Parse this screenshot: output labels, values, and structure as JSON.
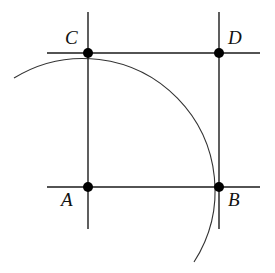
{
  "diagram": {
    "points": [
      {
        "id": "A",
        "label": "A"
      },
      {
        "id": "B",
        "label": "B"
      },
      {
        "id": "C",
        "label": "C"
      },
      {
        "id": "D",
        "label": "D"
      }
    ],
    "lines": [
      {
        "id": "vertical-through-A-C",
        "through": [
          "A",
          "C"
        ]
      },
      {
        "id": "vertical-through-B-D",
        "through": [
          "B",
          "D"
        ]
      },
      {
        "id": "horizontal-through-C-D",
        "through": [
          "C",
          "D"
        ]
      },
      {
        "id": "horizontal-through-A-B",
        "through": [
          "A",
          "B"
        ]
      }
    ],
    "arc": {
      "center": "A",
      "passes_through": [
        "C",
        "B"
      ]
    },
    "colors": {
      "stroke": "#1a1a1a",
      "point": "#000000",
      "background": "#ffffff"
    }
  }
}
